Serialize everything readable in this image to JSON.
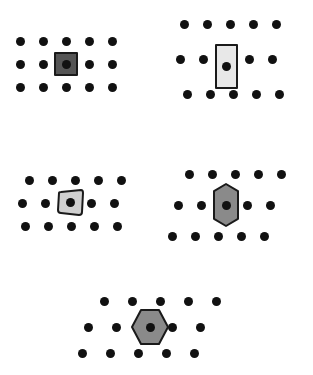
{
  "figure": {
    "background_color": "#ffffff",
    "dot_color": "#111111",
    "dot_diameter": 9,
    "outline_color": "#1a1a1a"
  },
  "chart_data": {
    "type": "scatter",
    "xlabel": "",
    "ylabel": "",
    "grid": false,
    "legend": false,
    "clusters": [
      {
        "id": "cluster-top-left",
        "name": "top-left-cluster",
        "origin_x": 20,
        "origin_y": 41,
        "col_spacing": 23,
        "row_spacing": 23,
        "cols": 5,
        "rows": 3,
        "row_offsets": [
          0,
          0,
          0
        ],
        "shape": {
          "name": "square",
          "kind": "square",
          "row": 1,
          "col": 2,
          "center_x": 66,
          "center_y": 64,
          "width": 22,
          "height": 22,
          "fill": "#555555",
          "stroke": "#1a1a1a",
          "stroke_width": 2,
          "rotation": 0
        }
      },
      {
        "id": "cluster-top-right",
        "name": "top-right-cluster",
        "origin_x": 184,
        "origin_y": 24,
        "col_spacing": 23,
        "row_spacing": 35,
        "cols": 5,
        "rows": 3,
        "row_offsets": [
          0,
          -4,
          3
        ],
        "shape": {
          "name": "tall-rectangle",
          "kind": "rect",
          "row": 1,
          "col": 2,
          "center_x": 226,
          "center_y": 66,
          "width": 21,
          "height": 43,
          "fill": "#e8e8e8",
          "stroke": "#1a1a1a",
          "stroke_width": 2,
          "rotation": 0
        }
      },
      {
        "id": "cluster-middle-left",
        "name": "middle-left-cluster",
        "origin_x": 25,
        "origin_y": 180,
        "col_spacing": 23,
        "row_spacing": 23,
        "cols": 5,
        "rows": 3,
        "row_offsets": [
          4,
          -3,
          0
        ],
        "shape": {
          "name": "skewed-square",
          "kind": "skewed-square",
          "row": 1,
          "col": 2,
          "center_x": 70,
          "center_y": 202,
          "width": 25,
          "height": 25,
          "fill": "#d0d0d0",
          "stroke": "#1a1a1a",
          "stroke_width": 2,
          "rotation": -6
        }
      },
      {
        "id": "cluster-middle-right",
        "name": "middle-right-cluster",
        "origin_x": 180,
        "origin_y": 174,
        "col_spacing": 23,
        "row_spacing": 31,
        "cols": 5,
        "rows": 3,
        "row_offsets": [
          9,
          -2,
          -8
        ],
        "shape": {
          "name": "tall-hexagon",
          "kind": "hex-vertical",
          "row": 1,
          "col": 2,
          "center_x": 226,
          "center_y": 205,
          "width": 24,
          "height": 42,
          "fill": "#8a8a8a",
          "stroke": "#1a1a1a",
          "stroke_width": 2,
          "rotation": 0
        }
      },
      {
        "id": "cluster-bottom-center",
        "name": "bottom-center-cluster",
        "origin_x": 98,
        "origin_y": 301,
        "col_spacing": 28,
        "row_spacing": 26,
        "cols": 5,
        "rows": 3,
        "row_offsets": [
          6,
          -10,
          -16
        ],
        "shape": {
          "name": "wide-hexagon",
          "kind": "hex-horizontal",
          "row": 1,
          "col": 2,
          "center_x": 150,
          "center_y": 327,
          "width": 36,
          "height": 34,
          "fill": "#8a8a8a",
          "stroke": "#1a1a1a",
          "stroke_width": 2,
          "rotation": 0
        }
      }
    ]
  }
}
